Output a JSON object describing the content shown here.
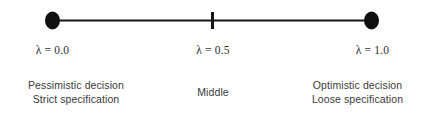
{
  "figure": {
    "type": "number-line",
    "background_color": "#ffffff",
    "line_color": "#141414",
    "text_color": "#3a3a3a"
  },
  "axis": {
    "min_value": "0.0",
    "mid_value": "0.5",
    "max_value": "1.0",
    "variable_symbol": "λ"
  },
  "points": [
    {
      "id": "left",
      "marker": "filled-dot",
      "value_label": "λ = 0.0",
      "desc_line1": "Pessimistic decision",
      "desc_line2": "Strict specification"
    },
    {
      "id": "middle",
      "marker": "tick",
      "value_label": "λ = 0.5",
      "desc_line1": "Middle",
      "desc_line2": ""
    },
    {
      "id": "right",
      "marker": "filled-dot",
      "value_label": "λ = 1.0",
      "desc_line1": "Optimistic decision",
      "desc_line2": "Loose specification"
    }
  ]
}
